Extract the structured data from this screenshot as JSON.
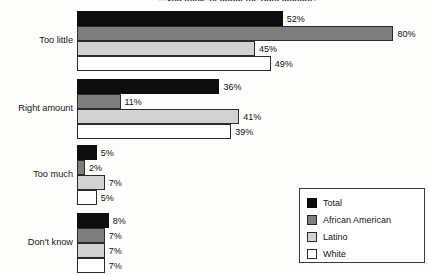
{
  "title_clipped": "…you think, or about the right amount?",
  "chart_data": {
    "type": "bar",
    "orientation": "horizontal",
    "title": "…you think, or about the right amount?",
    "xlabel": "",
    "ylabel": "",
    "xlim": [
      0,
      80
    ],
    "grid": false,
    "legend_position": "bottom-right",
    "value_suffix": "%",
    "categories": [
      "Too little",
      "Right amount",
      "Too much",
      "Don't know"
    ],
    "series": [
      {
        "name": "Total",
        "color": "#0d0d0d",
        "values": [
          52,
          36,
          5,
          8
        ]
      },
      {
        "name": "African American",
        "color": "#7e7e7e",
        "values": [
          80,
          11,
          2,
          7
        ]
      },
      {
        "name": "Latino",
        "color": "#d2d2d2",
        "values": [
          45,
          41,
          7,
          7
        ]
      },
      {
        "name": "White",
        "color": "#ffffff",
        "values": [
          49,
          39,
          5,
          7
        ]
      }
    ]
  },
  "groups": [
    {
      "label": "Too little",
      "bars": [
        {
          "series": "Total",
          "value": 52,
          "label": "52%"
        },
        {
          "series": "African American",
          "value": 80,
          "label": "80%"
        },
        {
          "series": "Latino",
          "value": 45,
          "label": "45%"
        },
        {
          "series": "White",
          "value": 49,
          "label": "49%"
        }
      ]
    },
    {
      "label": "Right amount",
      "bars": [
        {
          "series": "Total",
          "value": 36,
          "label": "36%"
        },
        {
          "series": "African American",
          "value": 11,
          "label": "11%"
        },
        {
          "series": "Latino",
          "value": 41,
          "label": "41%"
        },
        {
          "series": "White",
          "value": 39,
          "label": "39%"
        }
      ]
    },
    {
      "label": "Too much",
      "bars": [
        {
          "series": "Total",
          "value": 5,
          "label": "5%"
        },
        {
          "series": "African American",
          "value": 2,
          "label": "2%"
        },
        {
          "series": "Latino",
          "value": 7,
          "label": "7%"
        },
        {
          "series": "White",
          "value": 5,
          "label": "5%"
        }
      ]
    },
    {
      "label": "Don't know",
      "bars": [
        {
          "series": "Total",
          "value": 8,
          "label": "8%"
        },
        {
          "series": "African American",
          "value": 7,
          "label": "7%"
        },
        {
          "series": "Latino",
          "value": 7,
          "label": "7%"
        },
        {
          "series": "White",
          "value": 7,
          "label": "7%"
        }
      ]
    }
  ],
  "legend": {
    "items": [
      {
        "label": "Total",
        "swatch": "total",
        "color": "#0d0d0d"
      },
      {
        "label": "African American",
        "swatch": "aa",
        "color": "#7e7e7e"
      },
      {
        "label": "Latino",
        "swatch": "lat",
        "color": "#d2d2d2"
      },
      {
        "label": "White",
        "swatch": "wht",
        "color": "#ffffff"
      }
    ]
  },
  "layout": {
    "bar_origin_x": 77,
    "px_per_percent": 3.955,
    "bar_height": 15,
    "group_tops": [
      11,
      79,
      145,
      213
    ]
  }
}
